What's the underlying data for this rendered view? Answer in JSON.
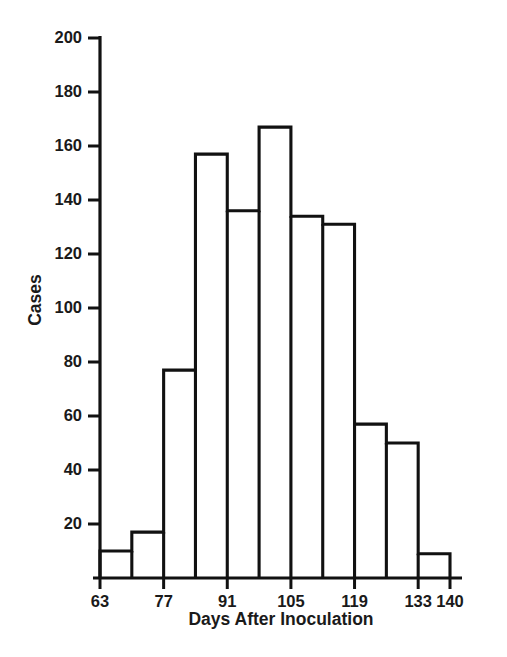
{
  "chart_data": {
    "type": "bar",
    "title": "",
    "subtitle": "",
    "xlabel": "Days After Inoculation",
    "ylabel": "Cases",
    "bin_width": 7,
    "bin_edges": [
      63,
      70,
      77,
      84,
      91,
      98,
      105,
      112,
      119,
      126,
      133,
      140
    ],
    "categories": [
      "63-70",
      "70-77",
      "77-84",
      "84-91",
      "91-98",
      "98-105",
      "105-112",
      "112-119",
      "119-126",
      "126-133",
      "133-140"
    ],
    "values": [
      10,
      17,
      77,
      157,
      136,
      167,
      134,
      131,
      57,
      50,
      9
    ],
    "xlim": [
      63,
      140
    ],
    "ylim": [
      0,
      200
    ],
    "x_ticks": [
      63,
      77,
      91,
      105,
      119,
      133,
      140
    ],
    "x_tick_labels": [
      "63",
      "77",
      "91",
      "105",
      "119",
      "133",
      "140"
    ],
    "y_ticks": [
      20,
      40,
      60,
      80,
      100,
      120,
      140,
      160,
      180,
      200
    ],
    "y_tick_labels": [
      "20",
      "40",
      "60",
      "80",
      "100",
      "120",
      "140",
      "160",
      "180",
      "200"
    ],
    "grid": false,
    "legend": false,
    "legend_position": "none",
    "bar_fill": "#ffffff",
    "bar_stroke": "#111111",
    "background": "#ffffff"
  }
}
